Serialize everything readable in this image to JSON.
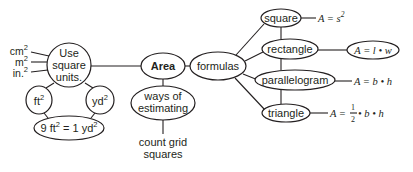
{
  "diagram": {
    "type": "concept-map",
    "colors": {
      "stroke": "#231f20",
      "background": "#ffffff"
    },
    "center": {
      "label": "Area"
    },
    "units_node": {
      "line1": "Use",
      "line2": "square",
      "line3": "units."
    },
    "unit_examples": [
      {
        "base": "cm",
        "exp": "2"
      },
      {
        "base": "m",
        "exp": "2"
      },
      {
        "base": "in.",
        "exp": "2"
      }
    ],
    "ft_node": {
      "base": "ft",
      "exp": "2"
    },
    "yd_node": {
      "base": "yd",
      "exp": "2"
    },
    "conversion_node": {
      "left": "9 ft",
      "left_exp": "2",
      "mid": " = 1 yd",
      "right_exp": "2"
    },
    "estimating_node": {
      "line1": "ways of",
      "line2": "estimating"
    },
    "estimating_leaf": {
      "line1": "count grid",
      "line2": "squares"
    },
    "formulas_node": {
      "label": "formulas"
    },
    "shapes": [
      {
        "label": "square",
        "formula": "A = s",
        "formula_exp": "2"
      },
      {
        "label": "rectangle",
        "formula": "A = l • w"
      },
      {
        "label": "parallelogram",
        "formula": "A = b • h"
      },
      {
        "label": "triangle",
        "formula_prefix": "A = ",
        "frac_num": "1",
        "frac_den": "2",
        "formula_suffix": " • b • h"
      }
    ]
  }
}
